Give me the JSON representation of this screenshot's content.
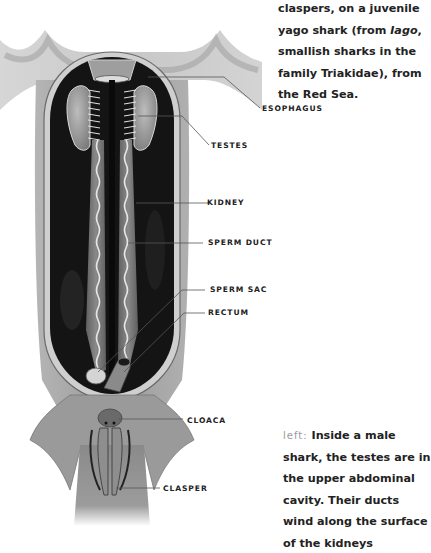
{
  "caption_top": {
    "lines": [
      "claspers, on a juvenile",
      "yago shark (from ",
      "smallish sharks in the",
      "family Triakidae), from",
      "the Red Sea."
    ],
    "italic_word": "Iago",
    "line2_suffix": ",",
    "line2_full": "yago shark (from Iago,"
  },
  "labels": [
    {
      "id": "esophagus",
      "text": "ESOPHAGUS"
    },
    {
      "id": "testes",
      "text": "TESTES"
    },
    {
      "id": "kidney",
      "text": "KIDNEY"
    },
    {
      "id": "sperm-duct",
      "text": "SPERM DUCT"
    },
    {
      "id": "sperm-sac",
      "text": "SPERM SAC"
    },
    {
      "id": "rectum",
      "text": "RECTUM"
    },
    {
      "id": "cloaca",
      "text": "CLOACA"
    },
    {
      "id": "clasper",
      "text": "CLASPER"
    }
  ],
  "caption_bottom": {
    "direction": "left:",
    "lines": [
      "Inside a male",
      "shark, the testes are in",
      "the upper abdominal",
      "cavity. Their ducts",
      "wind along the surface",
      "of the kidneys"
    ]
  },
  "colors": {
    "cavity": "#141414",
    "tissue": "#8c8c8c",
    "skin": "#a8a8a8",
    "leader_line": "#555555",
    "text": "#222222"
  }
}
